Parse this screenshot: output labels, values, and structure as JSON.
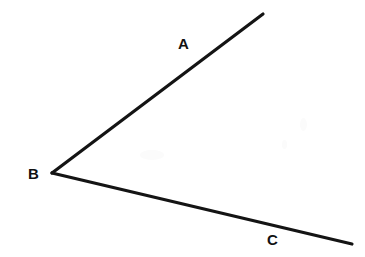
{
  "figure": {
    "type": "geometric-angle-diagram",
    "background_color": "#ffffff",
    "stroke_color": "#141414",
    "label_color": "#111111",
    "stroke_width": 3.2,
    "width": 365,
    "height": 257,
    "vertex": {
      "name": "B",
      "x": 52,
      "y": 173
    },
    "labels": [
      {
        "id": "A",
        "text": "A",
        "x": 178,
        "y": 36
      },
      {
        "id": "B",
        "text": "B",
        "x": 28,
        "y": 166
      },
      {
        "id": "C",
        "text": "C",
        "x": 267,
        "y": 232
      }
    ],
    "rays": [
      {
        "id": "ray-BA",
        "label": "A",
        "from": {
          "x": 52,
          "y": 173
        },
        "to": {
          "x": 263,
          "y": 14
        }
      },
      {
        "id": "ray-BC",
        "label": "C",
        "from": {
          "x": 52,
          "y": 173
        },
        "to": {
          "x": 352,
          "y": 244
        }
      }
    ]
  }
}
